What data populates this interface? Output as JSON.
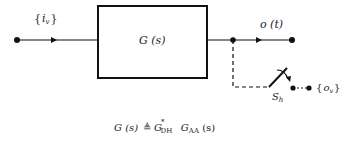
{
  "diagram": {
    "type": "block-diagram",
    "input": {
      "label_brace_open": "{",
      "label_var": "i",
      "label_sub": "v",
      "label_brace_close": "}"
    },
    "block": {
      "label": "G (s)"
    },
    "output": {
      "label": "o (t)"
    },
    "sampler": {
      "label_main": "S",
      "label_sub": "h"
    },
    "sampled_output": {
      "label_brace_open": "{",
      "label_var": "o",
      "label_sub": "v",
      "label_brace_close": "}"
    },
    "equation": {
      "lhs": "G (s)",
      "def_symbol": "≜",
      "term1_main": "G",
      "term1_sub": "DH",
      "term1_sup": "*",
      "term2_main": "G",
      "term2_sub": "AA",
      "term2_arg": " (s)"
    },
    "colors": {
      "line": "#111111",
      "background": "#ffffff"
    }
  }
}
